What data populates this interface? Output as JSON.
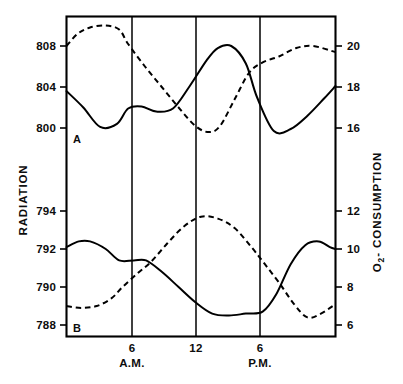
{
  "chart_data": {
    "type": "line",
    "title": "",
    "subtitle": "",
    "xlabel": "",
    "ylabel": "RADIATION",
    "y2label": "O2 - CONSUMPTION",
    "y2label_base": "O",
    "y2label_sub": "2",
    "y2label_rest": "- CONSUMPTION",
    "grid": true,
    "legend_position": "none",
    "x_tick_labels": [
      "6",
      "12",
      "6"
    ],
    "x_tick_sublabels": [
      "A.M.",
      "",
      "P.M."
    ],
    "x_tick_hours": [
      6,
      12,
      18
    ],
    "x_range_hours": [
      1.5,
      25.5
    ],
    "panels": [
      {
        "id": "A",
        "label": "A",
        "y_left_ticks": [
          808,
          804,
          800
        ],
        "y_right_ticks": [
          20,
          18,
          16
        ],
        "y_left_range": [
          797.0,
          810.2
        ],
        "y_right_range": [
          14.5,
          21.1
        ],
        "series": [
          {
            "name": "radiation-A",
            "style": "solid",
            "axis": "left",
            "x": [
              1.5,
              3.0,
              4.5,
              6.0,
              7.0,
              8.2,
              9.5,
              11.0,
              12.5,
              14.0,
              15.0,
              16.2,
              17.5,
              18.5,
              20.0,
              21.5,
              23.0,
              24.5,
              25.5
            ],
            "values": [
              803.6,
              802.0,
              800.1,
              800.4,
              801.9,
              802.1,
              801.6,
              801.9,
              804.1,
              806.6,
              807.8,
              808.0,
              806.3,
              803.0,
              799.7,
              799.9,
              801.2,
              802.9,
              804.1
            ]
          },
          {
            "name": "o2-consumption-A",
            "style": "dashed",
            "axis": "right",
            "x": [
              1.5,
              2.5,
              3.6,
              5.0,
              6.2,
              7.0,
              8.5,
              10.0,
              11.5,
              13.0,
              14.2,
              15.2,
              16.5,
              17.8,
              19.0,
              20.5,
              22.0,
              23.5,
              25.5
            ],
            "values": [
              20.0,
              20.6,
              20.9,
              21.0,
              20.8,
              20.1,
              19.0,
              18.0,
              17.0,
              16.1,
              15.8,
              16.1,
              17.4,
              18.7,
              19.2,
              19.5,
              19.9,
              20.0,
              19.7
            ]
          }
        ]
      },
      {
        "id": "B",
        "label": "B",
        "y_left_ticks": [
          794,
          792,
          790,
          788
        ],
        "y_right_ticks": [
          12,
          10,
          8,
          6
        ],
        "y_left_range": [
          787.0,
          795.0
        ],
        "y_right_range": [
          5.0,
          13.0
        ],
        "series": [
          {
            "name": "radiation-B",
            "style": "solid",
            "axis": "left",
            "x": [
              1.5,
              2.6,
              3.6,
              5.0,
              6.2,
              7.5,
              8.6,
              10.0,
              11.5,
              13.0,
              14.5,
              16.0,
              17.5,
              19.0,
              20.2,
              21.5,
              22.8,
              24.0,
              25.0,
              25.5
            ],
            "values": [
              792.1,
              792.4,
              792.4,
              792.0,
              791.4,
              791.4,
              791.4,
              790.8,
              790.0,
              789.2,
              788.6,
              788.5,
              788.6,
              788.7,
              789.6,
              791.2,
              792.2,
              792.4,
              792.1,
              792.0
            ]
          },
          {
            "name": "o2-consumption-B",
            "style": "dashed",
            "axis": "right",
            "x": [
              1.5,
              2.8,
              4.2,
              5.5,
              6.5,
              7.8,
              9.0,
              10.5,
              12.0,
              13.5,
              15.0,
              16.5,
              18.0,
              19.2,
              20.5,
              21.8,
              23.0,
              24.2,
              25.5
            ],
            "values": [
              7.0,
              6.9,
              7.0,
              7.4,
              8.0,
              8.7,
              9.3,
              10.3,
              11.2,
              11.7,
              11.6,
              11.1,
              10.1,
              9.2,
              8.2,
              7.1,
              6.4,
              6.6,
              7.1
            ]
          }
        ]
      }
    ]
  }
}
